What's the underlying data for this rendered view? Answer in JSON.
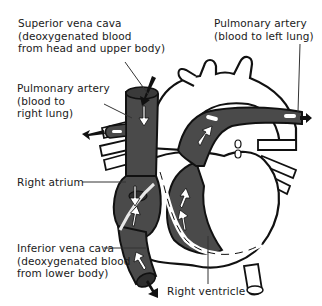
{
  "diagram": {
    "colors": {
      "deoxygenated_fill": "#4a4a4a",
      "outline": "#111111",
      "wall_fill": "#ffffff",
      "leader_line": "#333333"
    },
    "labels": {
      "superior_vena_cava": {
        "line1": "Superior vena cava",
        "line2": "(deoxygenated blood",
        "line3": "from head and upper body)"
      },
      "pulmonary_artery_left": {
        "line1": "Pulmonary artery",
        "line2": "(blood to left lung)"
      },
      "pulmonary_artery_right": {
        "line1": "Pulmonary artery",
        "line2": "(blood to",
        "line3": "right lung)"
      },
      "right_atrium": {
        "line1": "Right atrium"
      },
      "inferior_vena_cava": {
        "line1": "Inferior vena cava",
        "line2": "(deoxygenated blood",
        "line3": "from lower body)"
      },
      "right_ventricle": {
        "line1": "Right ventricle"
      }
    }
  }
}
